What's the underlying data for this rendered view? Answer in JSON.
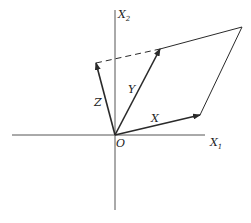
{
  "diagram": {
    "type": "vector parallelogram",
    "axes": {
      "x1_label": "X",
      "x1_sub": "1",
      "x2_label": "X",
      "x2_sub": "2",
      "origin_label": "O"
    },
    "vectors": [
      {
        "name": "X",
        "label": "X"
      },
      {
        "name": "Y",
        "label": "Y"
      },
      {
        "name": "Z",
        "label": "Z"
      }
    ],
    "colors": {
      "line": "#2a2a2a",
      "axis": "#555555"
    }
  }
}
